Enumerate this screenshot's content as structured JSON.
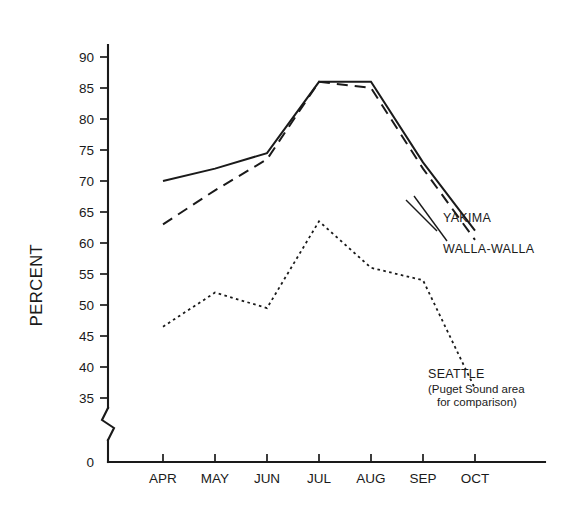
{
  "chart_data": {
    "type": "line",
    "title": "",
    "xlabel": "",
    "ylabel": "PERCENT",
    "categories": [
      "APR",
      "MAY",
      "JUN",
      "JUL",
      "AUG",
      "SEP",
      "OCT"
    ],
    "ylim": [
      35,
      90
    ],
    "ytick_step": 5,
    "yticks": [
      35,
      40,
      45,
      50,
      55,
      60,
      65,
      70,
      75,
      80,
      85,
      90
    ],
    "y_axis_break": true,
    "y_axis_origin_label": "0",
    "grid": false,
    "legend_position": "inline-right",
    "series": [
      {
        "name": "YAKIMA",
        "style": "solid",
        "values": [
          70,
          72,
          74.5,
          86,
          86,
          73,
          62
        ]
      },
      {
        "name": "WALLA-WALLA",
        "style": "dashed",
        "values": [
          63,
          68.5,
          73.5,
          86,
          85,
          72,
          60.5
        ]
      },
      {
        "name": "SEATTLE",
        "style": "dotted",
        "values": [
          46.5,
          52,
          49.5,
          63.5,
          56,
          54,
          36.5
        ],
        "annotation_line1": "(Puget Sound area",
        "annotation_line2": "for comparison)"
      }
    ]
  },
  "labels": {
    "y_axis_title": "PERCENT",
    "ytick_90": "90",
    "ytick_85": "85",
    "ytick_80": "80",
    "ytick_75": "75",
    "ytick_70": "70",
    "ytick_65": "65",
    "ytick_60": "60",
    "ytick_55": "55",
    "ytick_50": "50",
    "ytick_45": "45",
    "ytick_40": "40",
    "ytick_35": "35",
    "ytick_0": "0",
    "xtick_apr": "APR",
    "xtick_may": "MAY",
    "xtick_jun": "JUN",
    "xtick_jul": "JUL",
    "xtick_aug": "AUG",
    "xtick_sep": "SEP",
    "xtick_oct": "OCT",
    "series_yakima": "YAKIMA",
    "series_walla_walla": "WALLA-WALLA",
    "series_seattle": "SEATTLE",
    "seattle_note_1": "(Puget Sound area",
    "seattle_note_2": "for comparison)"
  },
  "colors": {
    "ink": "#1a1a1a",
    "background": "#ffffff"
  }
}
